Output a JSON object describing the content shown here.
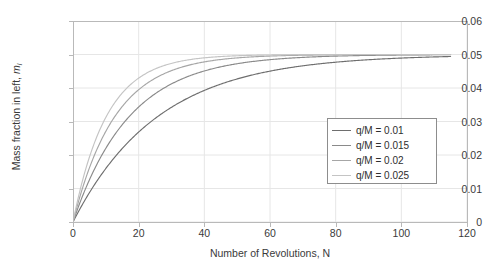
{
  "chart_data": {
    "type": "line",
    "title": "",
    "xlabel": "Number of Revolutions, N",
    "ylabel": "Mass fraction in left, m_l",
    "ylabel_text": "Mass fraction in left, ",
    "ylabel_symbol": "m",
    "ylabel_subscript": "l",
    "xlim": [
      0,
      120
    ],
    "ylim": [
      0,
      0.06
    ],
    "xticks": [
      "0",
      "20",
      "40",
      "60",
      "80",
      "100",
      "120"
    ],
    "xtick_values": [
      0,
      20,
      40,
      60,
      80,
      100,
      120
    ],
    "yticks": [
      "0",
      "0.01",
      "0.02",
      "0.03",
      "0.04",
      "0.05",
      "0.06"
    ],
    "ytick_values": [
      0,
      0.01,
      0.02,
      0.03,
      0.04,
      0.05,
      0.06
    ],
    "grid": true,
    "legend_position": "center right",
    "asymptote": 0.05,
    "x_data_max": 115,
    "series": [
      {
        "name": "q/M = 0.01",
        "color": "#6e6e6e",
        "rate": 0.0385,
        "x": [
          0,
          5,
          10,
          15,
          20,
          25,
          30,
          35,
          40,
          45,
          50,
          55,
          60,
          65,
          70,
          75,
          80,
          85,
          90,
          95,
          100,
          105,
          110,
          115
        ],
        "y": [
          0,
          0.00875,
          0.01596,
          0.02191,
          0.02681,
          0.03086,
          0.03419,
          0.03694,
          0.03921,
          0.04108,
          0.04262,
          0.04388,
          0.04492,
          0.04578,
          0.04649,
          0.04707,
          0.04758,
          0.04795,
          0.04826,
          0.04857,
          0.04882,
          0.04902,
          0.04919,
          0.04932
        ]
      },
      {
        "name": "q/M = 0.015",
        "color": "#8a8a8a",
        "rate": 0.058,
        "x": [
          0,
          5,
          10,
          15,
          20,
          25,
          30,
          35,
          40,
          45,
          50,
          55,
          60,
          65,
          70,
          75,
          80,
          85,
          90,
          95,
          100,
          105,
          110,
          115
        ],
        "y": [
          0,
          0.01255,
          0.02195,
          0.02898,
          0.03424,
          0.03818,
          0.04113,
          0.04333,
          0.04499,
          0.04623,
          0.04716,
          0.04786,
          0.04838,
          0.04878,
          0.04908,
          0.04931,
          0.04948,
          0.04961,
          0.04971,
          0.04978,
          0.04984,
          0.04988,
          0.04991,
          0.04994
        ]
      },
      {
        "name": "q/M = 0.02",
        "color": "#a6a6a6",
        "rate": 0.078,
        "x": [
          0,
          5,
          10,
          15,
          20,
          25,
          30,
          35,
          40,
          45,
          50,
          55,
          60,
          65,
          70,
          75,
          80,
          85,
          90,
          95,
          100,
          105,
          110,
          115
        ],
        "y": [
          0,
          0.01614,
          0.02707,
          0.03447,
          0.03948,
          0.04287,
          0.04517,
          0.04673,
          0.04778,
          0.0485,
          0.04898,
          0.04931,
          0.04953,
          0.04968,
          0.04978,
          0.04985,
          0.0499,
          0.04993,
          0.04996,
          0.04997,
          0.04998,
          0.04999,
          0.04999,
          0.05
        ]
      },
      {
        "name": "q/M = 0.025",
        "color": "#c4c4c4",
        "rate": 0.098,
        "x": [
          0,
          5,
          10,
          15,
          20,
          25,
          30,
          35,
          40,
          45,
          50,
          55,
          60,
          65,
          70,
          75,
          80,
          85,
          90,
          95,
          100,
          105,
          110,
          115
        ],
        "y": [
          0,
          0.01933,
          0.03117,
          0.03843,
          0.04288,
          0.0456,
          0.04731,
          0.04835,
          0.04899,
          0.04938,
          0.04962,
          0.04977,
          0.04986,
          0.04991,
          0.04995,
          0.04997,
          0.04998,
          0.04999,
          0.04999,
          0.05,
          0.05,
          0.05,
          0.05,
          0.05
        ]
      }
    ],
    "legend_entries": [
      {
        "label": "q/M = 0.01",
        "color": "#6e6e6e"
      },
      {
        "label": "q/M = 0.015",
        "color": "#8a8a8a"
      },
      {
        "label": "q/M = 0.02",
        "color": "#a6a6a6"
      },
      {
        "label": "q/M = 0.025",
        "color": "#c4c4c4"
      }
    ],
    "colors": {
      "grid": "#e6e6e6",
      "axis": "#b9b9b9",
      "text": "#3a3a3a",
      "legend_border": "#8d8d8d",
      "background": "#ffffff"
    }
  }
}
